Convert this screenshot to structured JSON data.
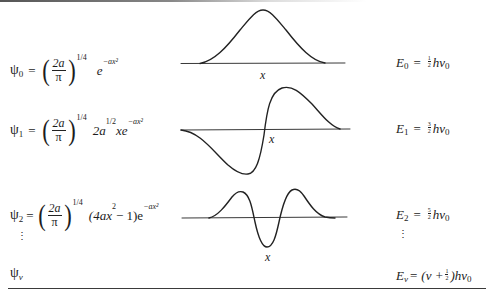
{
  "wavefunctions": [
    {
      "label": "ψ",
      "subscript": "0",
      "equals": "=",
      "prefactor_num": "2a",
      "prefactor_den": "π",
      "prefactor_exp": "1/4",
      "body_parts": [
        "e",
        "−ax²"
      ],
      "body_text": "e^(−ax²)"
    },
    {
      "label": "ψ",
      "subscript": "1",
      "equals": "=",
      "prefactor_num": "2a",
      "prefactor_den": "π",
      "prefactor_exp": "1/4",
      "body_text": "2a^(1/2) x e^(−ax²)",
      "body_coef": "2a",
      "body_coef_exp": "1/2",
      "body_x": "xe",
      "body_exp": "−ax²"
    },
    {
      "label": "ψ",
      "subscript": "2",
      "equals": "=",
      "prefactor_num": "2a",
      "prefactor_den": "π",
      "prefactor_exp": "1/4",
      "body_text": "(4ax² − 1)e^(−ax²)",
      "body_poly_open": "(4ax",
      "body_poly_exp": "2",
      "body_poly_close": " − 1)e",
      "body_exp": "−ax²"
    },
    {
      "label": "ψ",
      "subscript": "v"
    }
  ],
  "energies": [
    {
      "label": "E",
      "subscript": "0",
      "equals": "=",
      "frac_num": "1",
      "frac_den": "2",
      "tail": "hν",
      "tail_sub": "0"
    },
    {
      "label": "E",
      "subscript": "1",
      "equals": "=",
      "frac_num": "3",
      "frac_den": "2",
      "tail": "hν",
      "tail_sub": "0"
    },
    {
      "label": "E",
      "subscript": "2",
      "equals": "=",
      "frac_num": "5",
      "frac_den": "2",
      "tail": "hν",
      "tail_sub": "0"
    },
    {
      "label": "E",
      "subscript": "v",
      "equals": "=",
      "open": "(v +",
      "frac_num": "1",
      "frac_den": "2",
      "close": ")hν",
      "tail_sub": "0"
    }
  ],
  "plots": [
    {
      "name": "psi0-plot",
      "axis_label": "x",
      "shape": "gaussian, one peak, no nodes"
    },
    {
      "name": "psi1-plot",
      "axis_label": "x",
      "shape": "antisymmetric, one node"
    },
    {
      "name": "psi2-plot",
      "axis_label": "x",
      "shape": "symmetric, two nodes"
    }
  ],
  "ellipsis": "⋮",
  "colors": {
    "ink": "#1c1c1c",
    "rule": "#3a3a3a",
    "background": "#ffffff"
  }
}
